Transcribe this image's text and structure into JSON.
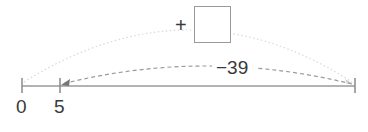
{
  "number_line": {
    "ticks": [
      {
        "label": "0",
        "x": 22
      },
      {
        "label": "5",
        "x": 60
      },
      {
        "label": "",
        "x": 355
      }
    ],
    "line_color": "#9a9a9a"
  },
  "top_jump": {
    "operator": "+",
    "answer_box": "",
    "from": "0",
    "style": "dotted"
  },
  "bottom_jump": {
    "label": "−39",
    "to": "5",
    "style": "dashed"
  }
}
